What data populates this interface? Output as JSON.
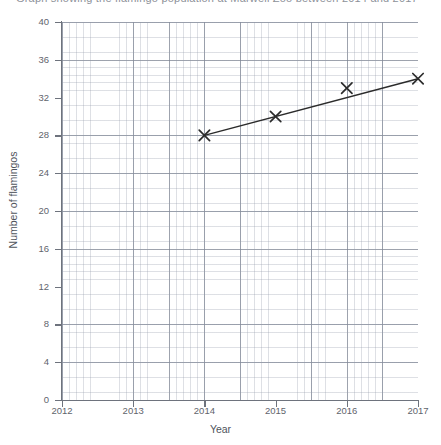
{
  "title": {
    "text": "Graph showing the flamingo population at Marwell Zoo between 2014 and 2017",
    "clipped": true
  },
  "axis_label_x": "Year",
  "axis_label_y": "Number of flamingos",
  "ticks_y": [
    "0",
    "4",
    "8",
    "12",
    "16",
    "20",
    "24",
    "28",
    "32",
    "36",
    "40"
  ],
  "ticks_x": [
    "2012",
    "2013",
    "2014",
    "2015",
    "2016",
    "2017"
  ],
  "colors": {
    "line": "#2b2b2b",
    "marker": "#2b2b2b",
    "grid_minor": "#9198a8",
    "grid_major": "#787f8e",
    "axis": "#6e737d",
    "text": "#5f646c",
    "background": "#ffffff"
  },
  "chart_data": {
    "type": "line",
    "title": "Graph showing the flamingo population at Marwell Zoo between 2014 and 2017",
    "xlabel": "Year",
    "ylabel": "Number of flamingos",
    "xlim": [
      2012,
      2017
    ],
    "ylim": [
      0,
      40
    ],
    "xticks": [
      2012,
      2013,
      2014,
      2015,
      2016,
      2017
    ],
    "yticks": [
      0,
      4,
      8,
      12,
      16,
      20,
      24,
      28,
      32,
      36,
      40
    ],
    "grid": true,
    "grid_minor": true,
    "legend": "none",
    "marker": "x",
    "x": [
      2014,
      2015,
      2016,
      2017
    ],
    "series": [
      {
        "name": "Number of flamingos",
        "values": [
          28,
          30,
          33,
          34
        ]
      }
    ],
    "trend_line": {
      "description": "straight line of best fit drawn from the 2014 point to the 2017 point",
      "start": [
        2014,
        28
      ],
      "end": [
        2017,
        34
      ]
    },
    "annotations": [
      "The 2016 marker (33) lies slightly above the straight line joining 2014 and 2017."
    ]
  }
}
